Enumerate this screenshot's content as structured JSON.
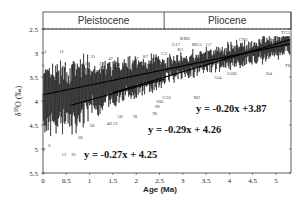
{
  "chart_data": {
    "type": "line",
    "title": "",
    "xlabel": "Age (Ma)",
    "ylabel": "δ18O (‰)",
    "xlim": [
      0,
      5.3
    ],
    "ylim": [
      5.5,
      2.5
    ],
    "y_inverted": true,
    "grid": false,
    "xticks": [
      "0",
      "0.5",
      "1",
      "1.5",
      "2",
      "2.5",
      "3",
      "3.5",
      "4",
      "4.5",
      "5"
    ],
    "yticks": [
      "2.5",
      "3",
      "3.5",
      "4",
      "4.5",
      "5",
      "5.5"
    ],
    "epochs": [
      {
        "name": "Pleistocene",
        "start": 0,
        "end": 2.6
      },
      {
        "name": "Pliocene",
        "start": 2.6,
        "end": 5.3
      }
    ],
    "series": [
      {
        "name": "benthic δ18O stack",
        "style": "oscillating line"
      },
      {
        "name": "fit 0–5.3 Ma",
        "equation": "y = -0.20x +3.87",
        "slope": -0.2,
        "intercept": 3.87,
        "x_range": [
          0,
          5.3
        ]
      },
      {
        "name": "fit intermediate",
        "equation": "y =  -0.29x + 4.26",
        "slope": -0.29,
        "intercept": 4.26,
        "x_range": [
          1.5,
          5.3
        ]
      },
      {
        "name": "fit 0–2.6 Ma",
        "equation": "y = -0.27x + 4.25",
        "slope": -0.27,
        "intercept": 4.25,
        "x_range": [
          0.6,
          2.6
        ]
      }
    ],
    "annotations": [
      {
        "label": "1",
        "x": 0.05,
        "y": 3.0
      },
      {
        "label": "2",
        "x": 0.02,
        "y": 5.05
      },
      {
        "label": "5",
        "x": 0.0,
        "y": 3.3
      },
      {
        "label": "6",
        "x": 0.14,
        "y": 4.95
      },
      {
        "label": "11",
        "x": 0.4,
        "y": 3.0
      },
      {
        "label": "12",
        "x": 0.45,
        "y": 5.15
      },
      {
        "label": "16",
        "x": 0.65,
        "y": 5.15
      },
      {
        "label": "19",
        "x": 0.78,
        "y": 3.45
      },
      {
        "label": "20",
        "x": 0.8,
        "y": 4.8
      },
      {
        "label": "25",
        "x": 0.95,
        "y": 3.25
      },
      {
        "label": "30",
        "x": 1.05,
        "y": 4.55
      },
      {
        "label": "31",
        "x": 1.07,
        "y": 3.1
      },
      {
        "label": "37",
        "x": 1.25,
        "y": 3.25
      },
      {
        "label": "47",
        "x": 1.45,
        "y": 3.15
      },
      {
        "label": "48",
        "x": 1.42,
        "y": 4.5
      },
      {
        "label": "52",
        "x": 1.55,
        "y": 4.5
      },
      {
        "label": "55",
        "x": 1.6,
        "y": 3.27
      },
      {
        "label": "58",
        "x": 1.65,
        "y": 4.35
      },
      {
        "label": "63",
        "x": 1.75,
        "y": 3.3
      },
      {
        "label": "77",
        "x": 2.0,
        "y": 3.15
      },
      {
        "label": "78",
        "x": 1.97,
        "y": 4.35
      },
      {
        "label": "87",
        "x": 2.2,
        "y": 3.1
      },
      {
        "label": "96",
        "x": 2.4,
        "y": 4.3
      },
      {
        "label": "98",
        "x": 2.45,
        "y": 4.15
      },
      {
        "label": "100",
        "x": 2.5,
        "y": 4.05
      },
      {
        "label": "G3",
        "x": 2.6,
        "y": 3.05
      },
      {
        "label": "G10",
        "x": 2.65,
        "y": 3.95
      },
      {
        "label": "G17",
        "x": 2.85,
        "y": 2.85
      },
      {
        "label": "K1",
        "x": 2.95,
        "y": 2.95
      },
      {
        "label": "KM5",
        "x": 3.05,
        "y": 2.72
      },
      {
        "label": "MG5",
        "x": 3.3,
        "y": 2.85
      },
      {
        "label": "M2",
        "x": 3.3,
        "y": 3.95
      },
      {
        "label": "G7",
        "x": 3.55,
        "y": 2.85
      },
      {
        "label": "Gi4",
        "x": 3.75,
        "y": 3.55
      },
      {
        "label": "Gi20",
        "x": 4.05,
        "y": 3.45
      },
      {
        "label": "CN1",
        "x": 4.3,
        "y": 2.75
      },
      {
        "label": "Si4",
        "x": 4.85,
        "y": 3.45
      },
      {
        "label": "TG5",
        "x": 5.2,
        "y": 2.6
      },
      {
        "label": "T8",
        "x": 5.25,
        "y": 3.3
      }
    ]
  }
}
